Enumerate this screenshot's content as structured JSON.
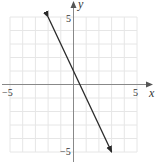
{
  "chart_data": {
    "type": "line",
    "title": "",
    "xlabel": "x",
    "ylabel": "y",
    "xlim": [
      -5,
      5
    ],
    "ylim": [
      -5,
      5
    ],
    "grid": true,
    "x_ticks_labeled": [
      "-5",
      "5"
    ],
    "y_ticks_labeled": [
      "5",
      "-5"
    ],
    "series": [
      {
        "name": "line",
        "equation": "y = -2x + 1",
        "points": [
          [
            -2,
            5
          ],
          [
            3,
            -5
          ]
        ],
        "arrows_both_ends": true
      }
    ]
  },
  "labels": {
    "x_min": "−5",
    "x_max": "5",
    "y_max": "5",
    "y_min": "−5",
    "x_axis": "x",
    "y_axis": "y"
  },
  "colors": {
    "grid": "#e6e6e6",
    "axis": "#888888",
    "line": "#2a2a2a"
  }
}
